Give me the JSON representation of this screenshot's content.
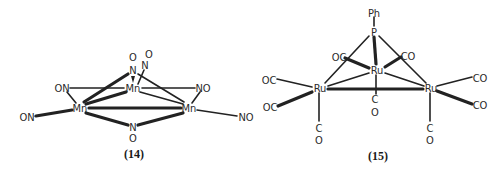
{
  "figure": {
    "structures": [
      {
        "id": "14",
        "label": "(14)",
        "description": "Trinuclear manganese nitrosyl cluster Mn3(NO)",
        "atoms": {
          "mn_top": "Mn",
          "mn_left": "Mn",
          "mn_right": "Mn",
          "n_top1": "N",
          "o_top1": "O",
          "n_top2": "N",
          "o_top2": "O",
          "on_left_upper": "ON",
          "no_right_upper": "NO",
          "on_left_lower": "ON",
          "no_right_lower": "NO",
          "n_bridge": "N",
          "o_bridge": "O"
        }
      },
      {
        "id": "15",
        "label": "(15)",
        "description": "Ru3(CO)9(μ3-PPh) cluster",
        "atoms": {
          "ph": "Ph",
          "p": "P",
          "ru_center": "Ru",
          "ru_left": "Ru",
          "ru_right": "Ru",
          "oc_top_left": "OC",
          "co_top_right": "CO",
          "oc_left_upper": "OC",
          "oc_left_lower": "OC",
          "co_right_upper": "CO",
          "co_right_lower": "CO",
          "c_center": "C",
          "o_center": "O",
          "c_left": "C",
          "o_left": "O",
          "c_right": "C",
          "o_right": "O"
        }
      }
    ]
  }
}
